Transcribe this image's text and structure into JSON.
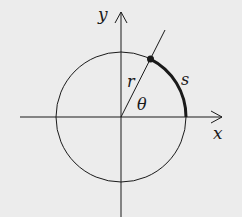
{
  "diagram": {
    "background": "#ececec",
    "stroke": "#1a1a1a",
    "center": {
      "x": 121,
      "y": 117
    },
    "radius": 65,
    "angle_deg": 63,
    "labels": {
      "x_axis": "x",
      "y_axis": "y",
      "radius": "r",
      "arc": "s",
      "angle": "θ"
    }
  }
}
